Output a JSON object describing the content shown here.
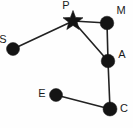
{
  "diagram": {
    "type": "constellation-node-link-graph",
    "width": 133,
    "height": 128,
    "background_color": "#fefefe",
    "node_color": "#141414",
    "edge_color": "#222222",
    "label_color": "#1a1a1a",
    "nodes": [
      {
        "id": "S",
        "label": "S",
        "shape": "circle",
        "x": 13,
        "y": 49,
        "r": 6.5,
        "label_x": 3,
        "label_y": 40,
        "label_anchor": "middle"
      },
      {
        "id": "P",
        "label": "P",
        "shape": "star",
        "x": 73,
        "y": 21,
        "r": 10.5,
        "label_x": 66,
        "label_y": 6,
        "label_anchor": "middle"
      },
      {
        "id": "M",
        "label": "M",
        "shape": "circle",
        "x": 107,
        "y": 23,
        "r": 6.8,
        "label_x": 121,
        "label_y": 11,
        "label_anchor": "middle"
      },
      {
        "id": "A",
        "label": "A",
        "shape": "circle",
        "x": 108,
        "y": 61,
        "r": 6.8,
        "label_x": 122,
        "label_y": 55,
        "label_anchor": "middle"
      },
      {
        "id": "E",
        "label": "E",
        "shape": "circle",
        "x": 56,
        "y": 95,
        "r": 6.5,
        "label_x": 42,
        "label_y": 94,
        "label_anchor": "middle"
      },
      {
        "id": "C",
        "label": "C",
        "shape": "circle",
        "x": 110,
        "y": 109,
        "r": 7.0,
        "label_x": 124,
        "label_y": 109,
        "label_anchor": "middle"
      }
    ],
    "edges": [
      {
        "id": "S-P",
        "from": "S",
        "to": "P",
        "x1": 13,
        "y1": 49,
        "x2": 73,
        "y2": 21
      },
      {
        "id": "P-M",
        "from": "P",
        "to": "M",
        "x1": 73,
        "y1": 21,
        "x2": 107,
        "y2": 23
      },
      {
        "id": "P-A",
        "from": "P",
        "to": "A",
        "x1": 73,
        "y1": 21,
        "x2": 108,
        "y2": 61
      },
      {
        "id": "M-A",
        "from": "M",
        "to": "A",
        "x1": 107,
        "y1": 23,
        "x2": 108,
        "y2": 61
      },
      {
        "id": "A-C",
        "from": "A",
        "to": "C",
        "x1": 108,
        "y1": 61,
        "x2": 110,
        "y2": 109
      },
      {
        "id": "E-C",
        "from": "E",
        "to": "C",
        "x1": 56,
        "y1": 95,
        "x2": 110,
        "y2": 109
      }
    ]
  }
}
